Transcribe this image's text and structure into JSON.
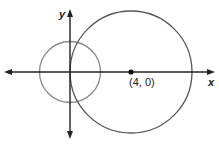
{
  "diagram": {
    "axes": {
      "x_label": "x",
      "y_label": "y"
    },
    "point": {
      "label": "(4, 0)",
      "x": 4,
      "y": 0
    },
    "circles": [
      {
        "name": "small-circle",
        "center": [
          0,
          0
        ],
        "radius": 2,
        "color": "#8a8a8a"
      },
      {
        "name": "large-circle",
        "center": [
          4,
          0
        ],
        "radius": 4,
        "color": "#555555"
      }
    ],
    "colors": {
      "axis": "#222222",
      "small_circle": "#8a8a8a",
      "large_circle": "#555555",
      "point": "#111111"
    }
  }
}
